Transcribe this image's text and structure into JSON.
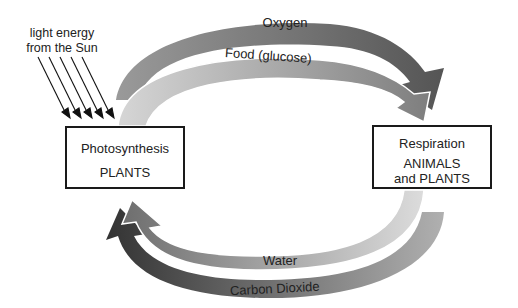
{
  "sun": {
    "label_line1": "light energy",
    "label_line2": "from the Sun",
    "ray_count": 5
  },
  "nodes": {
    "photosynthesis": {
      "title": "Photosynthesis",
      "subtitle": "PLANTS"
    },
    "respiration": {
      "title": "Respiration",
      "subtitle_line1": "ANIMALS",
      "subtitle_line2": "and PLANTS"
    }
  },
  "flows": {
    "oxygen": {
      "label": "Oxygen",
      "from": "Photosynthesis",
      "to": "Respiration",
      "color": "#7a7a7a"
    },
    "food": {
      "label": "Food (glucose)",
      "from": "Photosynthesis",
      "to": "Respiration",
      "color": "#a8a8a8"
    },
    "water": {
      "label": "Water",
      "from": "Respiration",
      "to": "Photosynthesis",
      "color": "#a0a0a0"
    },
    "carbon_dioxide": {
      "label": "Carbon Dioxide",
      "from": "Respiration",
      "to": "Photosynthesis",
      "color": "#6a6a6a"
    }
  }
}
